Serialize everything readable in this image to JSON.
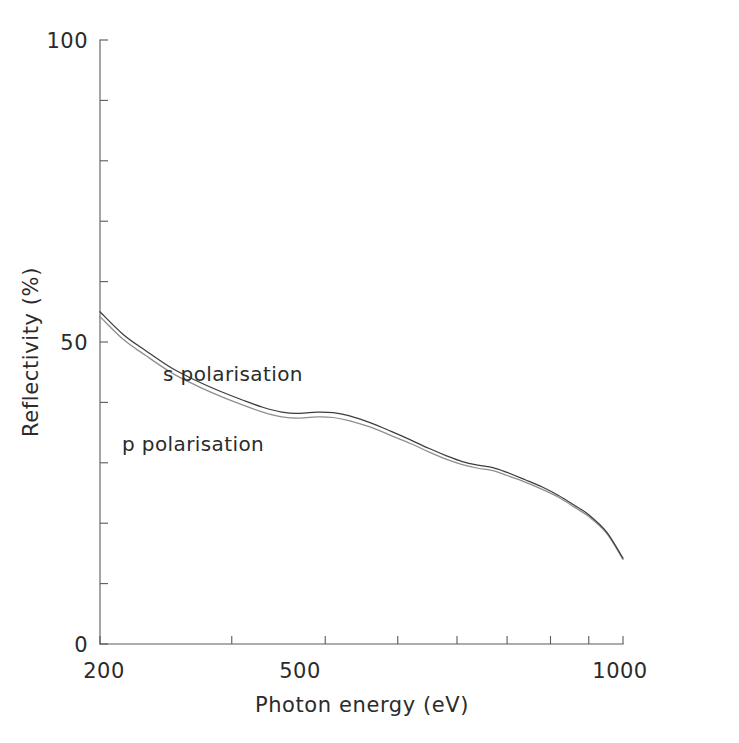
{
  "chart_data": {
    "type": "line",
    "title": "",
    "xlabel": "Photon energy (eV)",
    "ylabel": "Reflectivity (%)",
    "xscale": "log",
    "yscale": "linear",
    "xlim": [
      200,
      1000
    ],
    "ylim": [
      0,
      100
    ],
    "grid": false,
    "legend_position": "inline-annotation",
    "x_ticks": [
      200,
      300,
      400,
      500,
      600,
      700,
      800,
      900,
      1000
    ],
    "x_tick_labels": [
      "200",
      "",
      "",
      "500",
      "",
      "",
      "",
      "",
      "1000"
    ],
    "y_ticks": [
      0,
      10,
      20,
      30,
      40,
      50,
      60,
      70,
      80,
      90,
      100
    ],
    "y_tick_labels": [
      "0",
      "",
      "",
      "",
      "",
      "50",
      "",
      "",
      "",
      "",
      "100"
    ],
    "x": [
      200,
      215,
      230,
      250,
      270,
      290,
      310,
      330,
      350,
      370,
      390,
      410,
      430,
      460,
      490,
      520,
      550,
      580,
      610,
      640,
      670,
      700,
      740,
      780,
      820,
      860,
      900,
      950,
      1000
    ],
    "series": [
      {
        "name": "s polarisation",
        "label": "s polarisation",
        "color": "#3d3d3d",
        "values": [
          55.0,
          51.2,
          48.6,
          45.6,
          43.5,
          41.8,
          40.4,
          39.2,
          38.4,
          38.2,
          38.4,
          38.3,
          37.8,
          36.6,
          35.2,
          33.8,
          32.4,
          31.2,
          30.2,
          29.6,
          29.2,
          28.4,
          27.2,
          26.0,
          24.6,
          23.0,
          21.4,
          18.6,
          14.2
        ]
      },
      {
        "name": "p polarisation",
        "label": "p polarisation",
        "color": "#8e8e8e",
        "values": [
          54.2,
          50.4,
          47.8,
          44.8,
          42.7,
          41.0,
          39.6,
          38.4,
          37.6,
          37.4,
          37.6,
          37.5,
          37.0,
          35.9,
          34.5,
          33.2,
          31.8,
          30.6,
          29.7,
          29.1,
          28.7,
          27.9,
          26.8,
          25.6,
          24.3,
          22.7,
          21.1,
          18.4,
          14.0
        ]
      }
    ],
    "annotations": [
      {
        "text": "s polarisation",
        "x_px": 163,
        "y_px": 381
      },
      {
        "text": "p polarisation",
        "x_px": 122,
        "y_px": 451
      }
    ]
  },
  "axis": {
    "x_title": "Photon energy (eV)",
    "y_title": "Reflectivity (%)",
    "x_labels": {
      "left": "200",
      "middle": "500",
      "right": "1000"
    },
    "y_labels": {
      "bottom": "0",
      "middle": "50",
      "top": "100"
    }
  }
}
